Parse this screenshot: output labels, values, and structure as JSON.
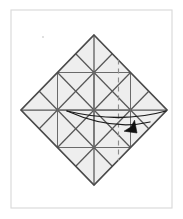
{
  "figure": {
    "kind": "origami-step-diagram",
    "title": "Origami crease pattern step",
    "caption": "",
    "canvas": {
      "width": 183,
      "height": 219,
      "background": "#ffffff"
    },
    "frame": {
      "name": "figure-border",
      "x": 11,
      "y": 10,
      "width": 161,
      "height": 198,
      "stroke": "#d8d8d8",
      "stroke_width": 1.1
    },
    "paper": {
      "shape": "diamond",
      "label": "square sheet rotated 45 degrees",
      "center": {
        "x": 94,
        "y": 110
      },
      "half_width": 73,
      "half_height": 75,
      "vertices": [
        {
          "name": "top",
          "x": 94,
          "y": 35
        },
        {
          "name": "right",
          "x": 167,
          "y": 110
        },
        {
          "name": "bottom",
          "x": 94,
          "y": 185
        },
        {
          "name": "left",
          "x": 21,
          "y": 110
        }
      ],
      "fill": "#eeeeee",
      "outline_color": "#4a4a4a",
      "outline_width": 1.7
    },
    "grid": {
      "divisions": 4,
      "description": "4 by 4 grid of creases parallel to the paper edges, plus horizontal, vertical and diagonal creases",
      "crease_color": "#575757",
      "crease_width": 1.25
    },
    "dashed_crease": {
      "name": "vertical-dashed-crease",
      "x": 118.5,
      "y_top": 59.5,
      "y_bottom": 161,
      "color": "#8d8d8d",
      "dash_pattern": "5 4"
    },
    "fold_arrow": {
      "name": "fold-arrow",
      "meaning": "fold the left flap over to the right",
      "color": "#111111",
      "arcs": [
        {
          "name": "fold-arc-upper",
          "start": {
            "x": 67,
            "y": 111
          },
          "control": {
            "x": 120,
            "y": 124
          },
          "end": {
            "x": 166,
            "y": 111
          }
        },
        {
          "name": "fold-arc-lower",
          "start": {
            "x": 67,
            "y": 111
          },
          "control": {
            "x": 112,
            "y": 131
          },
          "end": {
            "x": 150,
            "y": 122
          }
        }
      ],
      "head": {
        "name": "fold-arrowhead",
        "tip": {
          "x": 137,
          "y": 133
        },
        "direction": "down-right",
        "size": 13
      }
    },
    "marks": [
      {
        "name": "paper-speck",
        "x": 43,
        "y": 37,
        "r": 1.1,
        "color": "#d9d9d9"
      }
    ]
  }
}
